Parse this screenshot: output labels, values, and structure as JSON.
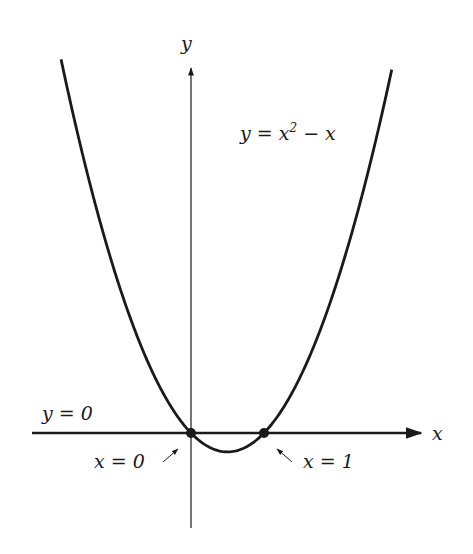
{
  "chart_data": {
    "type": "line",
    "title": "",
    "function": "y = x^2 - x",
    "xlabel": "x",
    "ylabel": "y",
    "series": [
      {
        "name": "y = x^2 - x",
        "x": [
          -1.78,
          -1.5,
          -1.0,
          -0.5,
          0,
          0.25,
          0.5,
          0.75,
          1.0,
          1.5,
          2.0,
          2.5,
          2.75
        ],
        "values": [
          4.95,
          3.75,
          2.0,
          0.75,
          0,
          -0.1875,
          -0.25,
          -0.1875,
          0,
          0.75,
          2.0,
          3.75,
          4.81
        ]
      }
    ],
    "marked_points": [
      {
        "x": 0,
        "y": 0,
        "label": "x = 0"
      },
      {
        "x": 1,
        "y": 0,
        "label": "x = 1"
      }
    ],
    "annotations": [
      "y = x² − x",
      "y = 0",
      "x = 0",
      "x = 1"
    ],
    "xlim": [
      -2.1,
      3.0
    ],
    "ylim": [
      -1.3,
      5.2
    ],
    "grid": false,
    "legend": "none"
  },
  "labels": {
    "y_axis": "y",
    "x_axis": "x",
    "curve_lhs": "y = x",
    "curve_exp": "2",
    "curve_rhs": " − x",
    "y_zero": "y = 0",
    "x_zero": "x = 0",
    "x_one": "x = 1",
    "arrow_left": "↗",
    "arrow_right": "↖"
  },
  "colors": {
    "ink": "#1a1a1a",
    "background": "#ffffff"
  }
}
